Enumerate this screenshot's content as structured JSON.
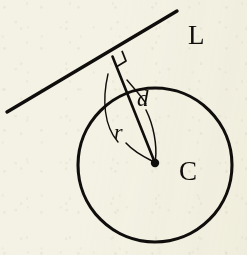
{
  "figure": {
    "kind": "geometry-diagram",
    "background_color": "#f4f2e4",
    "ink_color": "#100e0c"
  },
  "labels": {
    "line": "L",
    "distance": "d",
    "radius": "r",
    "center": "C"
  },
  "geometry": {
    "circle": {
      "center_x": 155,
      "center_y": 165,
      "radius": 77,
      "stroke_width": 3.1
    },
    "line": {
      "x1": 7,
      "y1": 112,
      "x2": 177,
      "y2": 11,
      "stroke_width": 3.4
    },
    "foot_point": {
      "x": 112,
      "y": 150
    },
    "perpendicular_segment": {
      "x1": 112.5,
      "y1": 56.5,
      "x2": 155,
      "y2": 163,
      "stroke_width": 2.6
    },
    "right_angle_marker": {
      "x": 112.5,
      "y": 56.5,
      "size": 11,
      "stroke_width": 1.7
    },
    "center_dot": {
      "x": 155,
      "y": 163,
      "radius": 4.2
    }
  },
  "label_positions": {
    "line": {
      "x": 188,
      "y": 44,
      "font_size": 27
    },
    "distance": {
      "x": 137,
      "y": 106,
      "font_size": 23
    },
    "radius": {
      "x": 114,
      "y": 139,
      "font_size": 22
    },
    "center": {
      "x": 179,
      "y": 180,
      "font_size": 27
    }
  },
  "leaders": {
    "distance_leader": {
      "path": "M 146 110 C 154 126, 157 146, 155.5 159",
      "stroke_width": 1.5
    },
    "radius_leader": {
      "path": "M 126 143 C 134 152, 146 158, 153 161.5",
      "stroke_width": 1.5
    },
    "radius_arc": {
      "path": "M 108 74 C 102 100, 104 126, 118 142",
      "stroke_width": 1.4
    },
    "distance_arc": {
      "path": "M 127 80 C 137 92, 143 98, 146 104",
      "stroke_width": 1.4
    }
  }
}
